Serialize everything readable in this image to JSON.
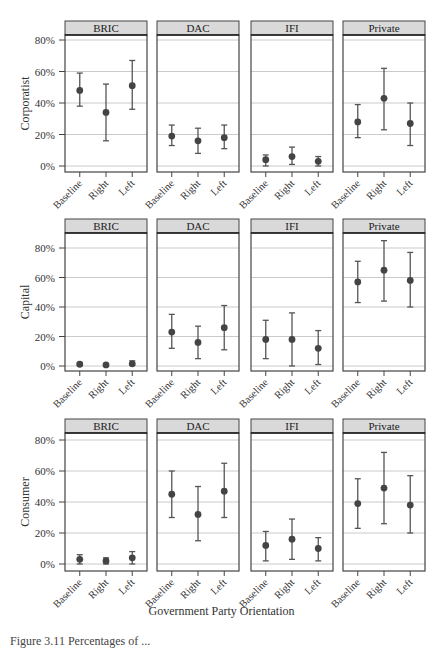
{
  "figure": {
    "x_axis_title": "Government Party Orientation",
    "caption_fragment": "Figure 3.11 Percentages of ..."
  },
  "style": {
    "strip_fill": "#d9d9d9",
    "panel_border": "#444444",
    "grid_color": "#bdbdbd",
    "point_color": "#444444",
    "errorbar_color": "#555555",
    "text_color": "#333333"
  },
  "chart_data": {
    "type": "scatter",
    "subtype": "point-with-errorbars (faceted grid)",
    "title": "",
    "xlabel": "Government Party Orientation",
    "facet_columns": [
      "BRIC",
      "DAC",
      "IFI",
      "Private"
    ],
    "facet_rows": [
      "Corporatist",
      "Capital",
      "Consumer"
    ],
    "categories": [
      "Baseline",
      "Right",
      "Left"
    ],
    "y_ticks": [
      "0%",
      "20%",
      "40%",
      "60%",
      "80%"
    ],
    "ylim": [
      -3,
      85
    ],
    "grid": true,
    "legend": null,
    "panels": [
      {
        "row": "Corporatist",
        "column": "BRIC",
        "points": [
          {
            "x": "Baseline",
            "y": 48,
            "lo": 38,
            "hi": 59
          },
          {
            "x": "Right",
            "y": 34,
            "lo": 16,
            "hi": 52
          },
          {
            "x": "Left",
            "y": 51,
            "lo": 36,
            "hi": 67
          }
        ]
      },
      {
        "row": "Corporatist",
        "column": "DAC",
        "points": [
          {
            "x": "Baseline",
            "y": 19,
            "lo": 13,
            "hi": 26
          },
          {
            "x": "Right",
            "y": 16,
            "lo": 8,
            "hi": 24
          },
          {
            "x": "Left",
            "y": 18,
            "lo": 11,
            "hi": 26
          }
        ]
      },
      {
        "row": "Corporatist",
        "column": "IFI",
        "points": [
          {
            "x": "Baseline",
            "y": 4,
            "lo": 0,
            "hi": 7
          },
          {
            "x": "Right",
            "y": 6,
            "lo": 1,
            "hi": 12
          },
          {
            "x": "Left",
            "y": 3,
            "lo": 0,
            "hi": 6
          }
        ]
      },
      {
        "row": "Corporatist",
        "column": "Private",
        "points": [
          {
            "x": "Baseline",
            "y": 28,
            "lo": 18,
            "hi": 39
          },
          {
            "x": "Right",
            "y": 43,
            "lo": 23,
            "hi": 62
          },
          {
            "x": "Left",
            "y": 27,
            "lo": 13,
            "hi": 40
          }
        ]
      },
      {
        "row": "Capital",
        "column": "BRIC",
        "points": [
          {
            "x": "Baseline",
            "y": 1.2,
            "lo": 0.3,
            "hi": 2.2
          },
          {
            "x": "Right",
            "y": 0.7,
            "lo": 0.2,
            "hi": 1.2
          },
          {
            "x": "Left",
            "y": 1.5,
            "lo": 0.5,
            "hi": 3.5
          }
        ]
      },
      {
        "row": "Capital",
        "column": "DAC",
        "points": [
          {
            "x": "Baseline",
            "y": 23,
            "lo": 12,
            "hi": 35
          },
          {
            "x": "Right",
            "y": 16,
            "lo": 5,
            "hi": 27
          },
          {
            "x": "Left",
            "y": 26,
            "lo": 11,
            "hi": 41
          }
        ]
      },
      {
        "row": "Capital",
        "column": "IFI",
        "points": [
          {
            "x": "Baseline",
            "y": 18,
            "lo": 5,
            "hi": 31
          },
          {
            "x": "Right",
            "y": 18,
            "lo": 0,
            "hi": 36
          },
          {
            "x": "Left",
            "y": 12,
            "lo": 1,
            "hi": 24
          }
        ]
      },
      {
        "row": "Capital",
        "column": "Private",
        "points": [
          {
            "x": "Baseline",
            "y": 57,
            "lo": 43,
            "hi": 71
          },
          {
            "x": "Right",
            "y": 65,
            "lo": 44,
            "hi": 85
          },
          {
            "x": "Left",
            "y": 58,
            "lo": 40,
            "hi": 77
          }
        ]
      },
      {
        "row": "Consumer",
        "column": "BRIC",
        "points": [
          {
            "x": "Baseline",
            "y": 3,
            "lo": 0,
            "hi": 6
          },
          {
            "x": "Right",
            "y": 2,
            "lo": 0,
            "hi": 4
          },
          {
            "x": "Left",
            "y": 4,
            "lo": 0,
            "hi": 8
          }
        ]
      },
      {
        "row": "Consumer",
        "column": "DAC",
        "points": [
          {
            "x": "Baseline",
            "y": 45,
            "lo": 30,
            "hi": 60
          },
          {
            "x": "Right",
            "y": 32,
            "lo": 15,
            "hi": 50
          },
          {
            "x": "Left",
            "y": 47,
            "lo": 30,
            "hi": 65
          }
        ]
      },
      {
        "row": "Consumer",
        "column": "IFI",
        "points": [
          {
            "x": "Baseline",
            "y": 12,
            "lo": 2,
            "hi": 21
          },
          {
            "x": "Right",
            "y": 16,
            "lo": 3,
            "hi": 29
          },
          {
            "x": "Left",
            "y": 10,
            "lo": 2,
            "hi": 17
          }
        ]
      },
      {
        "row": "Consumer",
        "column": "Private",
        "points": [
          {
            "x": "Baseline",
            "y": 39,
            "lo": 23,
            "hi": 55
          },
          {
            "x": "Right",
            "y": 49,
            "lo": 26,
            "hi": 72
          },
          {
            "x": "Left",
            "y": 38,
            "lo": 20,
            "hi": 57
          }
        ]
      }
    ]
  }
}
